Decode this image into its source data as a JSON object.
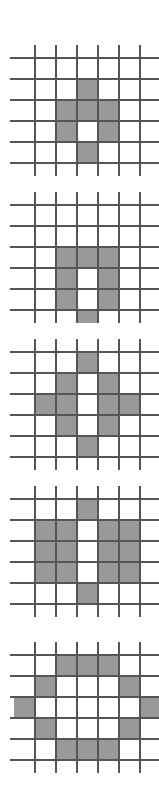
{
  "figure": {
    "title": "",
    "panel_count": 5,
    "colors": {
      "background": "#ffffff",
      "cell_fill": "#999999",
      "grid_line": "#555555",
      "grid_line_light": "#888888"
    },
    "geometry": {
      "cell_size": 21,
      "grid_lines_per_axis": 6,
      "grid_cells_per_axis": 5,
      "line_width": 1.6,
      "line_overhang": 13
    },
    "panels": [
      {
        "name": "panel-1",
        "label": "",
        "origin_x": 35,
        "origin_y": 58,
        "filled_cells": [
          [
            2,
            1
          ],
          [
            1,
            2
          ],
          [
            2,
            2
          ],
          [
            3,
            2
          ],
          [
            1,
            3
          ],
          [
            3,
            3
          ],
          [
            2,
            4
          ]
        ],
        "filled_count": 7,
        "shape": "small-diamond-ring"
      },
      {
        "name": "panel-2",
        "label": "",
        "origin_x": 35,
        "origin_y": 205,
        "filled_cells": [
          [
            1,
            2
          ],
          [
            2,
            2
          ],
          [
            3,
            2
          ],
          [
            1,
            3
          ],
          [
            3,
            3
          ],
          [
            1,
            4
          ],
          [
            3,
            4
          ],
          [
            2,
            5
          ]
        ],
        "filled_count": 8,
        "shape": "small-ring"
      },
      {
        "name": "panel-3",
        "label": "",
        "origin_x": 35,
        "origin_y": 352,
        "filled_cells": [
          [
            2,
            0
          ],
          [
            1,
            1
          ],
          [
            3,
            1
          ],
          [
            0,
            2
          ],
          [
            1,
            2
          ],
          [
            3,
            2
          ],
          [
            4,
            2
          ],
          [
            1,
            3
          ],
          [
            3,
            3
          ],
          [
            2,
            4
          ]
        ],
        "filled_count": 10,
        "shape": "medium-diamond-ring"
      },
      {
        "name": "panel-4",
        "label": "",
        "origin_x": 35,
        "origin_y": 499,
        "filled_cells": [
          [
            2,
            0
          ],
          [
            0,
            1
          ],
          [
            1,
            1
          ],
          [
            3,
            1
          ],
          [
            4,
            1
          ],
          [
            0,
            2
          ],
          [
            1,
            2
          ],
          [
            3,
            2
          ],
          [
            4,
            2
          ],
          [
            0,
            3
          ],
          [
            1,
            3
          ],
          [
            3,
            3
          ],
          [
            4,
            3
          ],
          [
            2,
            4
          ]
        ],
        "filled_count": 14,
        "shape": "filled-disk-with-vertical-notch"
      },
      {
        "name": "panel-5",
        "label": "",
        "origin_x": 35,
        "origin_y": 655,
        "filled_cells": [
          [
            1,
            0
          ],
          [
            2,
            0
          ],
          [
            3,
            0
          ],
          [
            0,
            1
          ],
          [
            4,
            1
          ],
          [
            -1,
            2
          ],
          [
            5,
            2
          ],
          [
            0,
            3
          ],
          [
            4,
            3
          ],
          [
            1,
            4
          ],
          [
            2,
            4
          ],
          [
            3,
            4
          ]
        ],
        "filled_count": 12,
        "shape": "large-circle-ring"
      }
    ]
  }
}
